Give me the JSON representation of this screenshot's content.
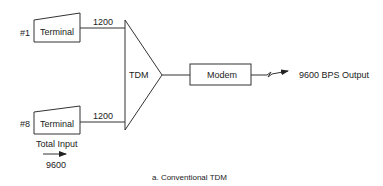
{
  "diagram": {
    "caption": "a. Conventional TDM",
    "terminals": [
      {
        "id_label": "#1",
        "label": "Terminal",
        "line_rate": "1200"
      },
      {
        "id_label": "#8",
        "label": "Terminal",
        "line_rate": "1200"
      }
    ],
    "multiplexer": {
      "label": "TDM"
    },
    "modem": {
      "label": "Modem"
    },
    "output": {
      "label": "9600 BPS Output"
    },
    "total_input": {
      "label": "Total Input",
      "value": "9600"
    }
  }
}
